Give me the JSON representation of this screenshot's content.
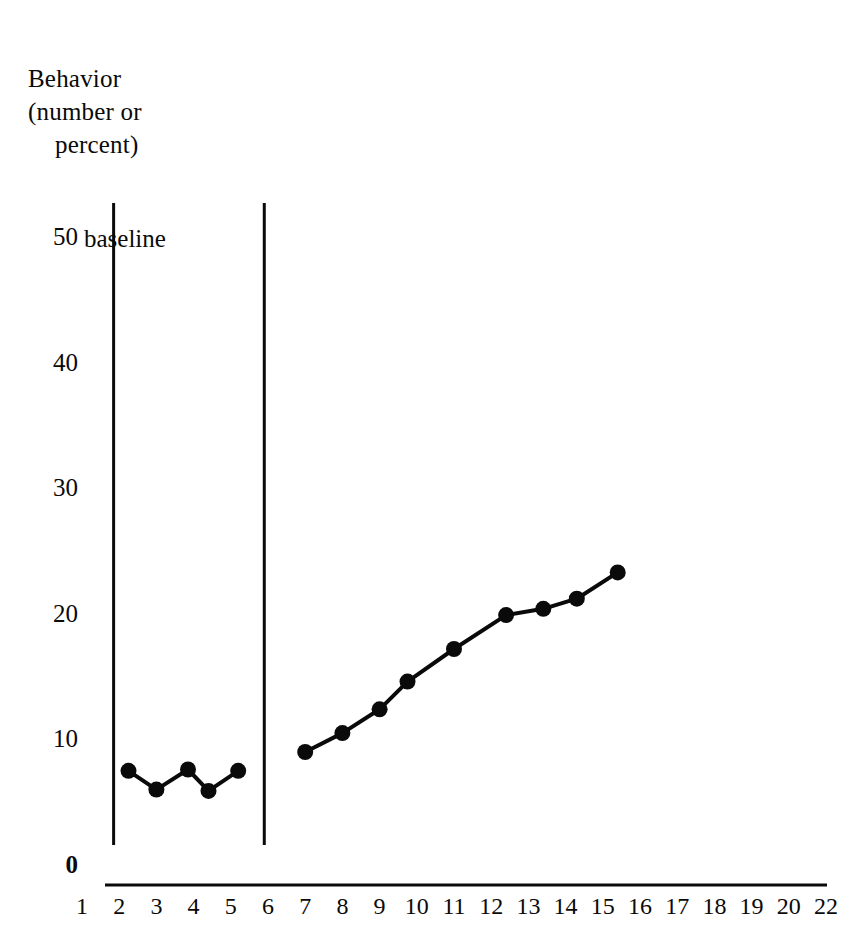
{
  "chart_data": {
    "type": "line",
    "title": "",
    "ylabel_lines": [
      "Behavior",
      "(number or",
      "percent)"
    ],
    "ylabel": "Behavior (number or percent)",
    "xlabel": "",
    "ylim": [
      0,
      50
    ],
    "yticks": [
      0,
      10,
      20,
      30,
      40,
      50
    ],
    "ytick_labels": [
      "0",
      "10",
      "20",
      "30",
      "40",
      "50"
    ],
    "xticks": [
      1,
      2,
      3,
      4,
      5,
      6,
      7,
      8,
      9,
      10,
      11,
      12,
      13,
      14,
      15,
      16,
      17,
      18,
      19,
      20,
      22
    ],
    "xtick_labels": [
      "1",
      "2",
      "3",
      "4",
      "5",
      "6",
      "7",
      "8",
      "9",
      "10",
      "11",
      "12",
      "13",
      "14",
      "15",
      "16",
      "17",
      "18",
      "19",
      "20",
      "22"
    ],
    "grid": false,
    "legend": null,
    "annotations": [
      {
        "text": "baseline",
        "x": 2.4,
        "y": 50
      }
    ],
    "phase_lines": [
      {
        "x": 1.85,
        "label": ""
      },
      {
        "x": 5.9,
        "label": ""
      }
    ],
    "series": [
      {
        "name": "baseline",
        "marker": "filled-circle",
        "x": [
          2.25,
          3.0,
          3.85,
          4.4,
          5.2
        ],
        "values": [
          7.5,
          6.0,
          7.6,
          5.9,
          7.5
        ]
      },
      {
        "name": "treatment",
        "marker": "filled-circle",
        "x": [
          7.0,
          8.0,
          9.0,
          9.75,
          11.0,
          12.4,
          13.4,
          14.3,
          15.4
        ],
        "values": [
          9.0,
          10.5,
          12.4,
          14.6,
          17.2,
          19.9,
          20.4,
          21.2,
          23.3
        ]
      }
    ]
  },
  "style": {
    "ink": "#0a0a0a",
    "background": "#ffffff"
  }
}
